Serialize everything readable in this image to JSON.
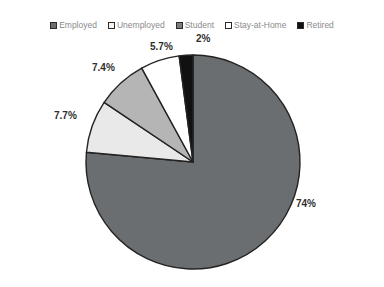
{
  "chart_data": {
    "type": "pie",
    "title": "",
    "categories": [
      "Employed",
      "Unemployed",
      "Student",
      "Stay-at-Home",
      "Retired"
    ],
    "values": [
      74,
      7.7,
      7.4,
      5.7,
      2
    ],
    "value_labels": [
      "74%",
      "7.7%",
      "7.4%",
      "5.7%",
      "2%"
    ],
    "colors": [
      "#6b6e70",
      "#e9e9e9",
      "#b5b5b5",
      "#ffffff",
      "#111111"
    ],
    "start_angle_deg": 0,
    "direction": "clockwise",
    "legend_position": "top",
    "grid": false,
    "xlabel": "",
    "ylabel": ""
  },
  "title": {
    "text": ""
  },
  "legend": {
    "items": [
      {
        "label": "Employed",
        "color": "#6b6e70",
        "swatch": "legend-swatch-employed"
      },
      {
        "label": "Unemployed",
        "color": "#f4f4f4",
        "swatch": "legend-swatch-unemployed"
      },
      {
        "label": "Student",
        "color": "#7b7d7e",
        "swatch": "legend-swatch-student"
      },
      {
        "label": "Stay-at-Home",
        "color": "#ffffff",
        "swatch": "legend-swatch-stayathome"
      },
      {
        "label": "Retired",
        "color": "#111111",
        "swatch": "legend-swatch-retired"
      }
    ]
  },
  "labels": {
    "employed": "74%",
    "unemployed": "7.7%",
    "student": "7.4%",
    "stayathome": "5.7%",
    "retired": "2%"
  },
  "colors": {
    "employed": "#6b6e70",
    "unemployed": "#e9e9e9",
    "student": "#b5b5b5",
    "stayathome": "#ffffff",
    "retired": "#111111",
    "outline": "#232323",
    "legend_text": "#8a8a8a",
    "label_text": "#2f2f2f",
    "background": "#ffffff"
  }
}
